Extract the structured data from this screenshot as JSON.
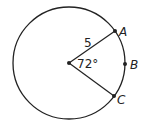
{
  "diagram": {
    "type": "circle-central-angle",
    "circle": {
      "cx": 69,
      "cy": 63,
      "r": 56
    },
    "center": {
      "x": 69,
      "y": 63
    },
    "points": [
      {
        "name": "A",
        "x": 115,
        "y": 31,
        "label_x": 119,
        "label_y": 36
      },
      {
        "name": "B",
        "x": 125,
        "y": 64,
        "label_x": 130,
        "label_y": 69
      },
      {
        "name": "C",
        "x": 114,
        "y": 96,
        "label_x": 117,
        "label_y": 104
      }
    ],
    "radius_label": "5",
    "angle_label": "72°",
    "colors": {
      "stroke": "#222222",
      "background": "#ffffff"
    }
  }
}
